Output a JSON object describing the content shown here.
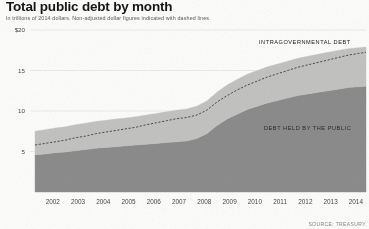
{
  "header": {
    "title": "Total public debt by month",
    "subtitle": "In trillions of 2014 dollars. Non-adjusted dollar figures indicated with dashed lines."
  },
  "source": {
    "label": "SOURCE: TREASURY"
  },
  "labels": {
    "intragovernmental": "INTRAGOVERNMENTAL DEBT",
    "public": "DEBT HELD BY THE PUBLIC"
  },
  "colors": {
    "public_area": "#8c8c8c",
    "intragovernmental_area": "#c3c3c1",
    "dashed_line": "#3a3a3c",
    "gridline": "#e3e2dd",
    "title": "#17171a",
    "subtitle": "#5b5b5e",
    "background": "#fdfdfb"
  },
  "chart_data": {
    "type": "area",
    "stacked": true,
    "title": "Total public debt by month",
    "subtitle": "In trillions of 2014 dollars. Non-adjusted dollar figures indicated with dashed lines.",
    "xlabel": "",
    "ylabel": "",
    "units": "trillions of 2014 dollars",
    "grid": true,
    "legend_position": "inline-annotation",
    "xlim": [
      2001.6,
      2014.9
    ],
    "ylim": [
      0,
      20
    ],
    "yticks": [
      5,
      10,
      15,
      20
    ],
    "ytick_labels": [
      "5",
      "10",
      "15",
      "$20"
    ],
    "xticks": [
      2002,
      2003,
      2004,
      2005,
      2006,
      2007,
      2008,
      2009,
      2010,
      2011,
      2012,
      2013,
      2014
    ],
    "xtick_labels": [
      "2002",
      "2003",
      "2004",
      "2005",
      "2006",
      "2007",
      "2008",
      "2009",
      "2010",
      "2011",
      "2012",
      "2013",
      "2014"
    ],
    "x": [
      2001.8,
      2002.2,
      2002.6,
      2003.0,
      2003.4,
      2003.8,
      2004.2,
      2004.6,
      2005.0,
      2005.4,
      2005.8,
      2006.2,
      2006.6,
      2007.0,
      2007.4,
      2007.8,
      2008.2,
      2008.6,
      2009.0,
      2009.4,
      2009.8,
      2010.2,
      2010.6,
      2011.0,
      2011.4,
      2011.8,
      2012.2,
      2012.6,
      2013.0,
      2013.4,
      2013.8,
      2014.2,
      2014.6,
      2014.9
    ],
    "series": [
      {
        "name": "DEBT HELD BY THE PUBLIC",
        "color": "#8c8c8c",
        "values": [
          4.6,
          4.7,
          4.85,
          4.95,
          5.1,
          5.25,
          5.4,
          5.5,
          5.6,
          5.7,
          5.8,
          5.9,
          6.0,
          6.1,
          6.2,
          6.3,
          6.6,
          7.2,
          8.2,
          9.0,
          9.6,
          10.2,
          10.6,
          11.0,
          11.3,
          11.6,
          11.9,
          12.1,
          12.3,
          12.5,
          12.7,
          12.9,
          13.0,
          13.05
        ]
      },
      {
        "name": "INTRAGOVERNMENTAL DEBT",
        "color": "#c3c3c1",
        "values": [
          2.9,
          3.0,
          3.05,
          3.1,
          3.2,
          3.25,
          3.3,
          3.35,
          3.4,
          3.45,
          3.5,
          3.6,
          3.7,
          3.8,
          3.9,
          3.95,
          4.0,
          4.05,
          4.1,
          4.2,
          4.3,
          4.35,
          4.4,
          4.45,
          4.5,
          4.55,
          4.6,
          4.65,
          4.7,
          4.75,
          4.78,
          4.8,
          4.82,
          4.85
        ]
      }
    ],
    "total_real": [
      7.5,
      7.7,
      7.9,
      8.05,
      8.3,
      8.5,
      8.7,
      8.85,
      9.0,
      9.15,
      9.3,
      9.5,
      9.7,
      9.9,
      10.1,
      10.25,
      10.6,
      11.25,
      12.3,
      13.2,
      13.9,
      14.55,
      15.0,
      15.45,
      15.8,
      16.15,
      16.5,
      16.75,
      17.0,
      17.25,
      17.48,
      17.7,
      17.82,
      17.9
    ],
    "nominal_line": {
      "name": "Non-adjusted (nominal) total debt",
      "style": "dashed",
      "color": "#3a3a3c",
      "values": [
        5.8,
        6.0,
        6.2,
        6.4,
        6.7,
        6.9,
        7.2,
        7.4,
        7.6,
        7.8,
        8.0,
        8.3,
        8.55,
        8.8,
        9.05,
        9.2,
        9.5,
        10.1,
        11.1,
        11.9,
        12.6,
        13.2,
        13.7,
        14.2,
        14.6,
        15.0,
        15.4,
        15.7,
        16.0,
        16.3,
        16.6,
        16.9,
        17.1,
        17.25
      ]
    }
  }
}
